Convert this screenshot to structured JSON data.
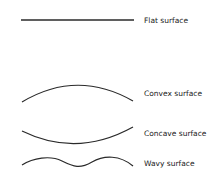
{
  "figure": {
    "stroke_color": "#2a2a2a",
    "items": [
      {
        "shape": "flat-line",
        "label": "Flat surface"
      },
      {
        "shape": "convex-arc",
        "label": "Convex surface"
      },
      {
        "shape": "concave-arc",
        "label": "Concave surface"
      },
      {
        "shape": "wavy-line",
        "label": "Wavy surface"
      }
    ]
  }
}
